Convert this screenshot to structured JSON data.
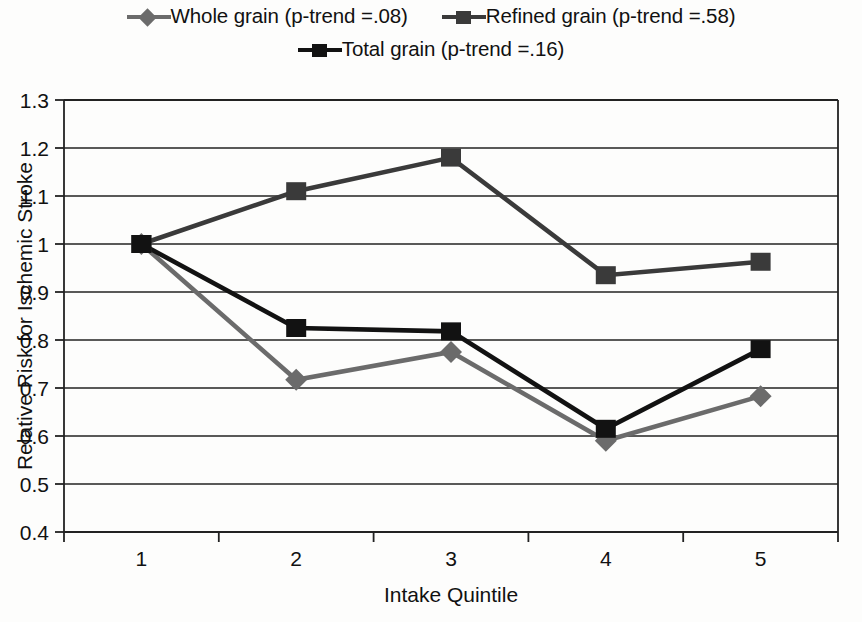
{
  "chart_data": {
    "type": "line",
    "title": "",
    "xlabel": "Intake Quintile",
    "ylabel": "Relative Risk for Ischemic Stroke",
    "categories": [
      "1",
      "2",
      "3",
      "4",
      "5"
    ],
    "x": [
      1,
      2,
      3,
      4,
      5
    ],
    "ylim": [
      0.4,
      1.3
    ],
    "ytick_labels": [
      "1.3",
      "1.2",
      "1.1",
      "1",
      "0.9",
      "0.8",
      "0.7",
      "0.6",
      "0.5",
      "0.4"
    ],
    "ytick_values": [
      1.3,
      1.2,
      1.1,
      1.0,
      0.9,
      0.8,
      0.7,
      0.6,
      0.5,
      0.4
    ],
    "grid": "horizontal",
    "legend_position": "top",
    "series": [
      {
        "name": "Whole grain (p-trend =.08)",
        "short_name": "Whole grain",
        "p_trend": ".08",
        "marker": "diamond",
        "color": "#6b6b6b",
        "values": [
          1.0,
          0.717,
          0.775,
          0.59,
          0.683
        ]
      },
      {
        "name": "Refined grain (p-trend =.58)",
        "short_name": "Refined grain",
        "p_trend": ".58",
        "marker": "square",
        "color": "#3a3a3a",
        "values": [
          1.0,
          1.11,
          1.18,
          0.935,
          0.963
        ]
      },
      {
        "name": "Total grain (p-trend =.16)",
        "short_name": "Total grain",
        "p_trend": ".16",
        "marker": "square",
        "color": "#121212",
        "values": [
          1.0,
          0.825,
          0.818,
          0.615,
          0.781
        ]
      }
    ]
  },
  "legend": {
    "rows": [
      [
        "Whole grain (p-trend =.08)",
        "Refined grain (p-trend =.58)"
      ],
      [
        "Total grain (p-trend =.16)"
      ]
    ]
  },
  "axes": {
    "x_title": "Intake Quintile",
    "y_title": "Relative Risk for Ischemic Stroke"
  }
}
